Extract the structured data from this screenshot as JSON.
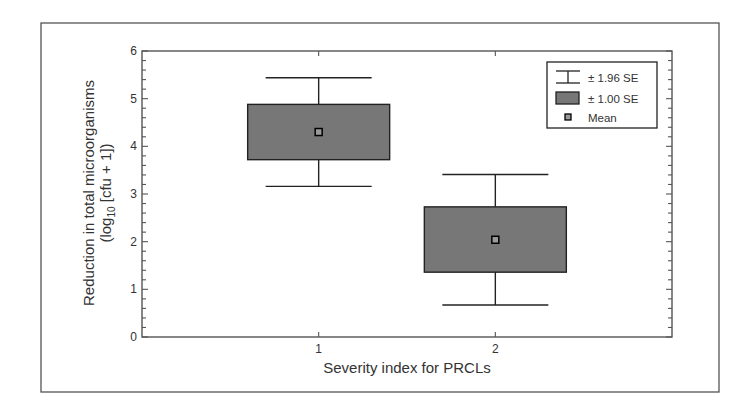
{
  "chart_data": {
    "type": "box",
    "title": "",
    "xlabel": "Severity index for PRCLs",
    "ylabel_line1": "Reduction in total microorganisms",
    "ylabel_line2_prefix": "(log",
    "ylabel_line2_sub": "10",
    "ylabel_line2_suffix": " [cfu + 1])",
    "categories": [
      "1",
      "2"
    ],
    "x_positions": [
      1,
      2
    ],
    "xlim": [
      0.0,
      3.0
    ],
    "ylim": [
      0,
      6
    ],
    "yticks": [
      0,
      1,
      2,
      3,
      4,
      5,
      6
    ],
    "y_minor_step": 0.2,
    "grid": false,
    "legend_position": "upper right",
    "series": [
      {
        "name": "Mean",
        "values": [
          4.3,
          2.04
        ]
      },
      {
        "name": "± 1.00 SE lower",
        "values": [
          3.72,
          1.36
        ]
      },
      {
        "name": "± 1.00 SE upper",
        "values": [
          4.88,
          2.73
        ]
      },
      {
        "name": "± 1.96 SE lower",
        "values": [
          3.16,
          0.67
        ]
      },
      {
        "name": "± 1.96 SE upper",
        "values": [
          5.44,
          3.41
        ]
      }
    ],
    "legend": [
      {
        "symbol": "whisker",
        "label": "± 1.96 SE"
      },
      {
        "symbol": "box",
        "label": "± 1.00 SE"
      },
      {
        "symbol": "mean",
        "label": "Mean"
      }
    ],
    "colors": {
      "box_fill": "#777777",
      "mean_fill": "#9a9a9a",
      "line": "#222222",
      "frame": "#555555",
      "text": "#333333"
    }
  }
}
